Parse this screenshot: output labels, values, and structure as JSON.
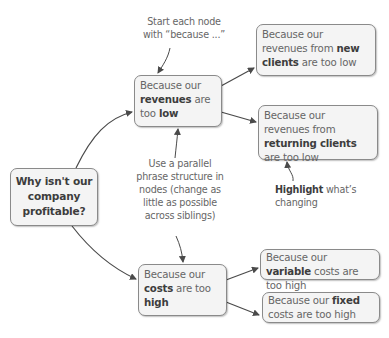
{
  "diagram": {
    "root": {
      "text": "Why isn't our company profitable?",
      "lines": [
        "Why isn't our",
        "company",
        "profitable?"
      ]
    },
    "branches": [
      {
        "id": "revenues",
        "parts": {
          "pre": "Because our ",
          "bold1": "revenues",
          "mid": " are too ",
          "bold2": "low"
        },
        "children": [
          {
            "id": "new-clients",
            "parts": {
              "pre": "Because our revenues from ",
              "bold": "new clients",
              "post": " are too low"
            }
          },
          {
            "id": "returning-clients",
            "parts": {
              "pre": "Because our revenues from ",
              "bold": "returning clients",
              "post": " are too low"
            }
          }
        ]
      },
      {
        "id": "costs",
        "parts": {
          "pre": "Because our ",
          "bold1": "costs",
          "mid": " are too ",
          "bold2": "high"
        },
        "children": [
          {
            "id": "variable-costs",
            "parts": {
              "pre": "Because our ",
              "bold": "variable",
              "post": " costs are too high"
            }
          },
          {
            "id": "fixed-costs",
            "parts": {
              "pre": "Because our ",
              "bold": "fixed",
              "post": " costs are too high"
            }
          }
        ]
      }
    ],
    "annotations": [
      {
        "id": "start-because",
        "text": "Start each node with “because ...”",
        "lines": [
          "Start each node",
          "with “because ...”"
        ]
      },
      {
        "id": "parallel-structure",
        "text": "Use a parallel phrase structure in nodes (change as little as possible across siblings)",
        "lines": [
          "Use a parallel",
          "phrase structure in",
          "nodes (change as",
          "little as possible",
          "across siblings)"
        ]
      },
      {
        "id": "highlight",
        "bold": "Highlight",
        "rest": " what's changing",
        "lines": [
          "what’s",
          "changing"
        ]
      }
    ],
    "colors": {
      "node_fill": "#f4f4f4",
      "node_border": "#8a8a8a",
      "text": "#666666",
      "bold_text": "#3d3d3d",
      "arrow": "#4a4a4a"
    }
  }
}
